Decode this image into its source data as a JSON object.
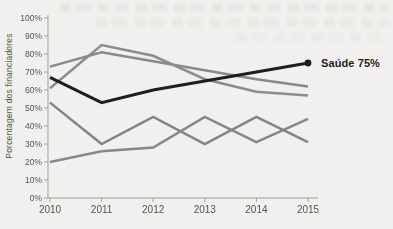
{
  "figure": {
    "kind": "scanned line chart, single highlighted series with end label"
  },
  "chart_data": {
    "type": "line",
    "title": "",
    "xlabel": "",
    "ylabel": "Porcentagem dos financiadores",
    "x": [
      2010,
      2011,
      2012,
      2013,
      2014,
      2015
    ],
    "x_tick_labels": [
      "2010",
      "2011",
      "2012",
      "2013",
      "2014",
      "2015"
    ],
    "y_tick_labels": [
      "0%",
      "10%",
      "20%",
      "30%",
      "40%",
      "50%",
      "60%",
      "70%",
      "80%",
      "90%",
      "100%"
    ],
    "ylim": [
      0,
      100
    ],
    "grid": false,
    "legend": "none",
    "annotation": {
      "text": "Saúde 75%",
      "x": 2015,
      "y": 75
    },
    "series": [
      {
        "name": "",
        "role": "context",
        "color": "#898989",
        "values": [
          73,
          81,
          76,
          71,
          66,
          62
        ]
      },
      {
        "name": "",
        "role": "context",
        "color": "#8c8c8c",
        "values": [
          61,
          85,
          79,
          66,
          59,
          57
        ]
      },
      {
        "name": "",
        "role": "context",
        "color": "#848484",
        "values": [
          53,
          30,
          45,
          30,
          45,
          31
        ]
      },
      {
        "name": "",
        "role": "context",
        "color": "#878787",
        "values": [
          20,
          26,
          28,
          45,
          31,
          44
        ]
      },
      {
        "name": "Saúde",
        "role": "highlight",
        "color": "#1e1e1e",
        "values": [
          67,
          53,
          60,
          65,
          70,
          75
        ],
        "endpoint_dot": true
      }
    ],
    "colors": {
      "page_bg": "#f1f0ee",
      "axis": "#a09f9c",
      "tick_text": "#57534e",
      "highlight": "#1e1e1e",
      "context_line": "#8a8a8a"
    }
  }
}
